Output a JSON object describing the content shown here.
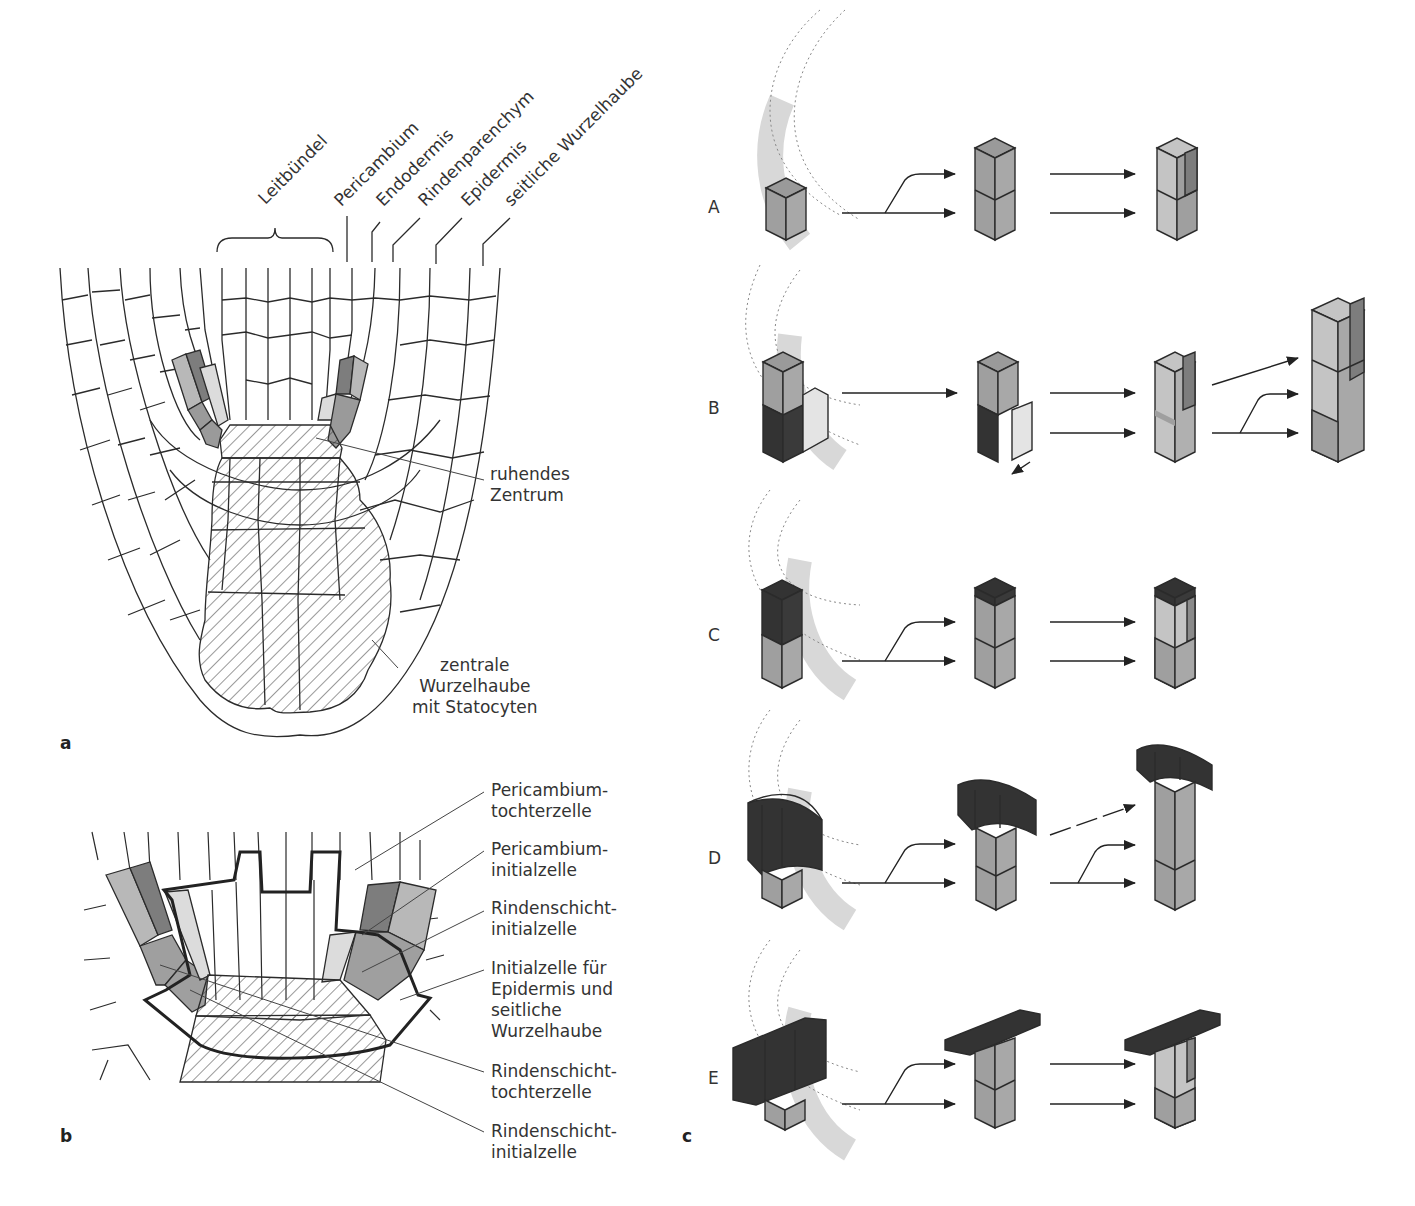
{
  "figure": {
    "panels": {
      "a": {
        "letter": "a",
        "top_labels": [
          "Leitbündel",
          "Pericambium",
          "Endodermis",
          "Rindenparenchym",
          "Epidermis",
          "seitliche Wurzelhaube"
        ],
        "side_labels": {
          "quiescent_center": [
            "ruhendes",
            "Zentrum"
          ],
          "central_cap": [
            "zentrale",
            "Wurzelhaube",
            "mit Statocyten"
          ]
        }
      },
      "b": {
        "letter": "b",
        "legend": [
          [
            "Pericambium-",
            "tochterzelle"
          ],
          [
            "Pericambium-",
            "initialzelle"
          ],
          [
            "Rindenschicht-",
            "initialzelle"
          ],
          [
            "Initialzelle für",
            "Epidermis und",
            "seitliche",
            "Wurzelhaube"
          ],
          [
            "Rindenschicht-",
            "tochterzelle"
          ],
          [
            "Rindenschicht-",
            "initialzelle"
          ]
        ]
      },
      "c": {
        "letter": "c",
        "rows": [
          "A",
          "B",
          "C",
          "D",
          "E"
        ]
      }
    },
    "colors": {
      "line": "#2b2b2b",
      "cell_dark": "#7d7d7d",
      "cell_mid": "#9f9f9f",
      "cell_light": "#c4c4c4",
      "cell_pale": "#dcdcdc",
      "cap_black": "#2e2e2e",
      "arc_band": "#d8d8d8",
      "dotted": "#888888"
    }
  }
}
